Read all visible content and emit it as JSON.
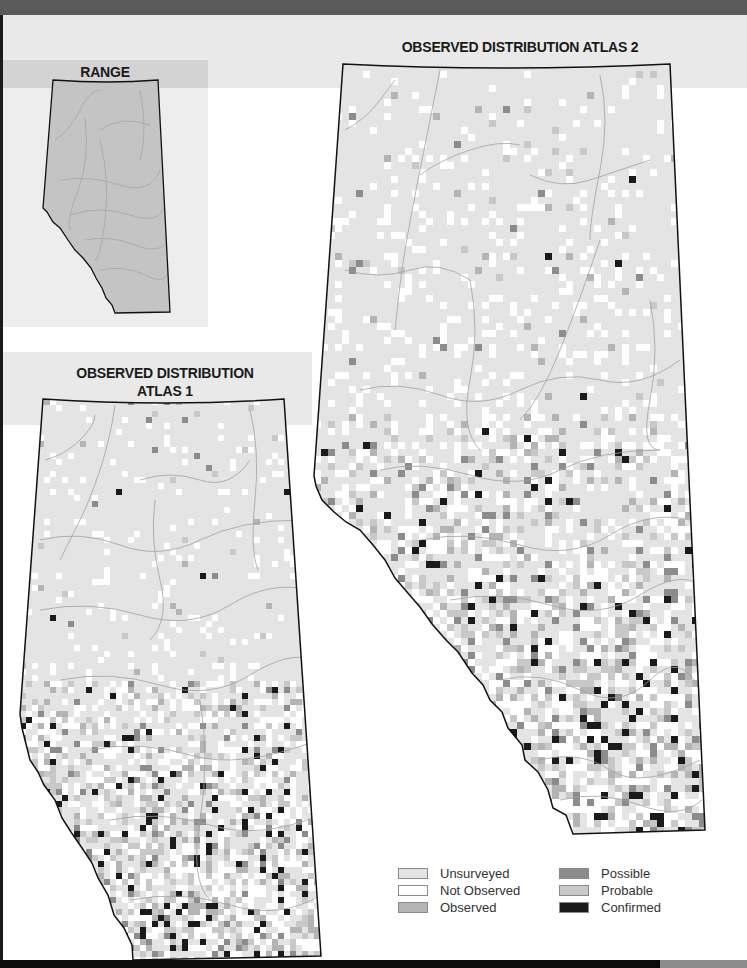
{
  "titles": {
    "range": "RANGE",
    "atlas1_line1": "OBSERVED DISTRIBUTION",
    "atlas1_line2": "ATLAS 1",
    "atlas2": "OBSERVED DISTRIBUTION ATLAS 2"
  },
  "colors": {
    "unsurveyed": "#e4e4e4",
    "not_observed": "#ffffff",
    "observed": "#b4b4b4",
    "possible": "#8c8c8c",
    "probable": "#c8c8c8",
    "confirmed": "#1a1a1a",
    "range_fill": "#c4c4c4",
    "river": "#9a9a9a",
    "outline": "#111111"
  },
  "legend": {
    "items": [
      {
        "label": "Unsurveyed",
        "color": "#e4e4e4"
      },
      {
        "label": "Not Observed",
        "color": "#ffffff"
      },
      {
        "label": "Observed",
        "color": "#b4b4b4"
      },
      {
        "label": "Possible",
        "color": "#8c8c8c"
      },
      {
        "label": "Probable",
        "color": "#c8c8c8"
      },
      {
        "label": "Confirmed",
        "color": "#1a1a1a"
      }
    ]
  },
  "maps": [
    {
      "id": "range",
      "title": "RANGE",
      "type": "range"
    },
    {
      "id": "atlas1",
      "title": "OBSERVED DISTRIBUTION ATLAS 1",
      "type": "distribution"
    },
    {
      "id": "atlas2",
      "title": "OBSERVED DISTRIBUTION ATLAS 2",
      "type": "distribution"
    }
  ]
}
